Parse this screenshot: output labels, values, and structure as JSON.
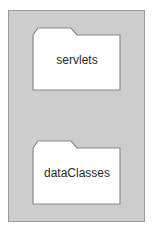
{
  "diagram": {
    "container": {
      "fill": "#cdcdcd",
      "stroke": "#9a9a9a"
    },
    "folders": [
      {
        "label": "servlets"
      },
      {
        "label": "dataClasses"
      }
    ]
  }
}
